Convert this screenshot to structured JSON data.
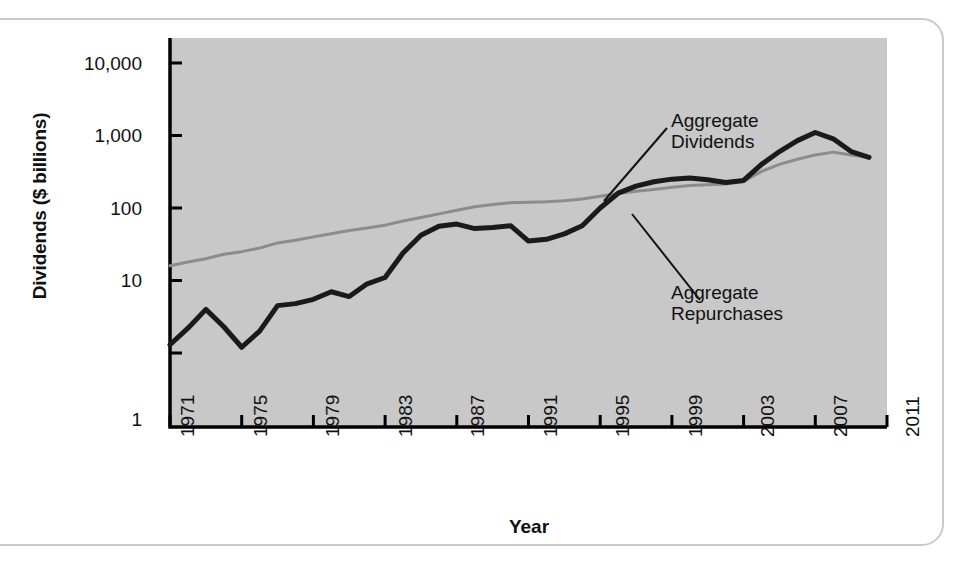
{
  "figure": {
    "background_color": "#ffffff",
    "frame_color": "#c9c9c9",
    "plot_background_color": "#c8c8c8",
    "axis_color": "#000000"
  },
  "chart_data": {
    "type": "line",
    "title": "",
    "xlabel": "Year",
    "ylabel": "Dividends ($ billions)",
    "yscale": "log",
    "ylim": [
      0.5,
      10000
    ],
    "xlim": [
      1971,
      2011
    ],
    "grid": false,
    "legend_position": "annotations-inline",
    "ytick_labels": [
      "10,000",
      "1,000",
      "100",
      "10",
      "1"
    ],
    "ytick_values": [
      10000,
      1000,
      100,
      10,
      1
    ],
    "xtick_labels": [
      "1971",
      "1975",
      "1979",
      "1983",
      "1987",
      "1991",
      "1995",
      "1999",
      "2003",
      "2007",
      "2011"
    ],
    "xtick_values": [
      1971,
      1975,
      1979,
      1983,
      1987,
      1991,
      1995,
      1999,
      2003,
      2007,
      2011
    ],
    "x": [
      1971,
      1972,
      1973,
      1974,
      1975,
      1976,
      1977,
      1978,
      1979,
      1980,
      1981,
      1982,
      1983,
      1984,
      1985,
      1986,
      1987,
      1988,
      1989,
      1990,
      1991,
      1992,
      1993,
      1994,
      1995,
      1996,
      1997,
      1998,
      1999,
      2000,
      2001,
      2002,
      2003,
      2004,
      2005,
      2006,
      2007,
      2008,
      2009,
      2010
    ],
    "series": [
      {
        "name": "Aggregate Dividends",
        "color": "#8c8c8c",
        "line_width": 3,
        "values": [
          16,
          18,
          20,
          23,
          25,
          28,
          33,
          36,
          40,
          44,
          49,
          53,
          58,
          66,
          74,
          83,
          93,
          104,
          112,
          118,
          120,
          122,
          126,
          133,
          145,
          158,
          170,
          180,
          193,
          205,
          210,
          215,
          232,
          320,
          400,
          470,
          540,
          590,
          540,
          500
        ],
        "annotation": {
          "text_line1": "Aggregate",
          "text_line2": "Dividends",
          "points_to_year": 1993
        }
      },
      {
        "name": "Aggregate Repurchases",
        "color": "#1a1a1a",
        "line_width": 5,
        "values": [
          1.3,
          2.2,
          4.0,
          2.3,
          1.2,
          2.0,
          4.5,
          4.8,
          5.5,
          7.0,
          6.0,
          9.0,
          11,
          24,
          42,
          56,
          60,
          52,
          54,
          57,
          35,
          37,
          44,
          57,
          100,
          160,
          200,
          230,
          250,
          260,
          245,
          225,
          240,
          400,
          600,
          850,
          1100,
          900,
          600,
          500
        ],
        "annotation": {
          "text_line1": "Aggregate",
          "text_line2": "Repurchases",
          "points_to_year": 1996
        }
      }
    ]
  }
}
